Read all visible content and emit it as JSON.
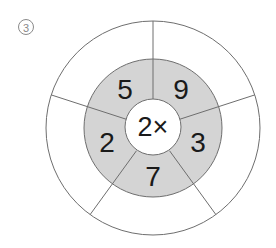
{
  "problem": {
    "number_label": "③"
  },
  "wheel": {
    "center_label": "2×",
    "operator": "×",
    "multiplier": "2",
    "segments": [
      {
        "position": "top-left",
        "value": "5",
        "answer": ""
      },
      {
        "position": "top-right",
        "value": "9",
        "answer": ""
      },
      {
        "position": "right",
        "value": "3",
        "answer": ""
      },
      {
        "position": "bottom",
        "value": "7",
        "answer": ""
      },
      {
        "position": "left",
        "value": "2",
        "answer": ""
      }
    ],
    "colors": {
      "middle_ring_fill": "#d4d4d4",
      "outer_ring_fill": "#ffffff",
      "center_fill": "#ffffff",
      "stroke": "#6e6e6e",
      "text": "#1a1a1a"
    }
  }
}
